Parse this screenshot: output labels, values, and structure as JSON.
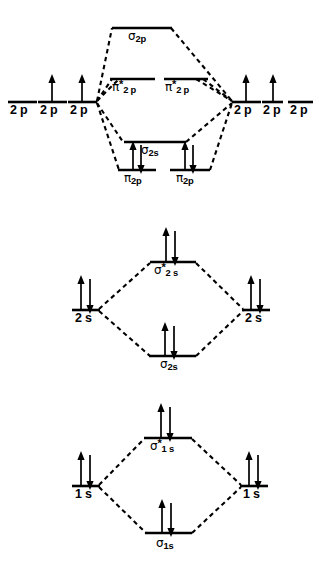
{
  "figure": {
    "type": "mo-diagram",
    "background_color": "#ffffff",
    "line_color": "#000000"
  },
  "panels": [
    {
      "id": "p-block-panel",
      "name": "2p molecular orbital panel",
      "atomic_label": "2 p",
      "levels": [
        {
          "name": "sigma-2p-antibonding",
          "greek": "σ",
          "star": "",
          "sub": "2p",
          "electrons": 0
        },
        {
          "name": "pi-2p-antibonding-a",
          "greek": "π",
          "star": "*",
          "sub": "2 p",
          "electrons": 0
        },
        {
          "name": "pi-2p-antibonding-b",
          "greek": "π",
          "star": "*",
          "sub": "2 p",
          "electrons": 0
        },
        {
          "name": "sigma-2s-bonding-center",
          "greek": "σ",
          "star": "",
          "sub": "2s",
          "electrons": 0
        },
        {
          "name": "pi-2p-bonding-a",
          "greek": "π",
          "star": "",
          "sub": "2p",
          "electrons": 2
        },
        {
          "name": "pi-2p-bonding-b",
          "greek": "π",
          "star": "",
          "sub": "2p",
          "electrons": 2
        }
      ],
      "left_atomic_orbitals": [
        {
          "name": "left-2p-1",
          "label": "2 p",
          "electrons": 0
        },
        {
          "name": "left-2p-2",
          "label": "2 p",
          "electrons": 1
        },
        {
          "name": "left-2p-3",
          "label": "2 p",
          "electrons": 1
        }
      ],
      "right_atomic_orbitals": [
        {
          "name": "right-2p-1",
          "label": "2 p",
          "electrons": 1
        },
        {
          "name": "right-2p-2",
          "label": "2 p",
          "electrons": 1
        },
        {
          "name": "right-2p-3",
          "label": "2 p",
          "electrons": 0
        }
      ]
    },
    {
      "id": "s2-block-panel",
      "name": "2s molecular orbital panel",
      "atomic_label": "2 s",
      "antibonding": {
        "name": "sigma-2s-antibonding",
        "greek": "σ",
        "star": "*",
        "sub": "2 s",
        "electrons": 2
      },
      "bonding": {
        "name": "sigma-2s-bonding",
        "greek": "σ",
        "star": "",
        "sub": "2s",
        "electrons": 2
      },
      "left_atomic_orbitals": [
        {
          "name": "left-2s",
          "label": "2 s",
          "electrons": 2
        }
      ],
      "right_atomic_orbitals": [
        {
          "name": "right-2s",
          "label": "2 s",
          "electrons": 2
        }
      ]
    },
    {
      "id": "s1-block-panel",
      "name": "1s molecular orbital panel",
      "atomic_label": "1 s",
      "antibonding": {
        "name": "sigma-1s-antibonding",
        "greek": "σ",
        "star": "*",
        "sub": "1 s",
        "electrons": 2
      },
      "bonding": {
        "name": "sigma-1s-bonding",
        "greek": "σ",
        "star": "",
        "sub": "1s",
        "electrons": 2
      },
      "left_atomic_orbitals": [
        {
          "name": "left-1s",
          "label": "1 s",
          "electrons": 2
        }
      ],
      "right_atomic_orbitals": [
        {
          "name": "right-1s",
          "label": "1 s",
          "electrons": 2
        }
      ]
    }
  ],
  "labels": {
    "sigma_2p": {
      "greek": "σ",
      "sub": "2p"
    },
    "pi_star_2p_a": {
      "greek": "π",
      "star": "*",
      "sub": "2 p"
    },
    "pi_star_2p_b": {
      "greek": "π",
      "star": "*",
      "sub": "2 p"
    },
    "sigma_2s_center": {
      "greek": "σ",
      "sub": "2s"
    },
    "pi_2p_a": {
      "greek": "π",
      "sub": "2p"
    },
    "pi_2p_b": {
      "greek": "π",
      "sub": "2p"
    },
    "sigma_star_2s": {
      "greek": "σ",
      "star": "*",
      "sub": "2 s"
    },
    "sigma_2s": {
      "greek": "σ",
      "sub": "2s"
    },
    "sigma_star_1s": {
      "greek": "σ",
      "star": "*",
      "sub": "1 s"
    },
    "sigma_1s": {
      "greek": "σ",
      "sub": "1s"
    },
    "ao_2p_l1": "2 p",
    "ao_2p_l2": "2 p",
    "ao_2p_l3": "2 p",
    "ao_2p_r1": "2 p",
    "ao_2p_r2": "2 p",
    "ao_2p_r3": "2 p",
    "ao_2s_l": "2 s",
    "ao_2s_r": "2 s",
    "ao_1s_l": "1 s",
    "ao_1s_r": "1 s"
  }
}
